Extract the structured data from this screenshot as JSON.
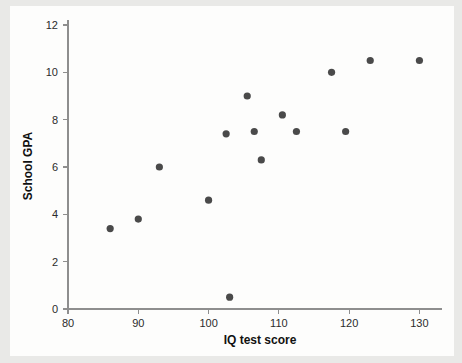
{
  "chart_data": {
    "type": "scatter",
    "title": "",
    "xlabel": "IQ test score",
    "ylabel": "School GPA",
    "xlim": [
      80,
      132.5
    ],
    "ylim": [
      0,
      12
    ],
    "xticks": [
      80,
      90,
      100,
      110,
      120,
      130
    ],
    "yticks": [
      0,
      2,
      4,
      6,
      8,
      10,
      12
    ],
    "xtick_labels": [
      "80",
      "90",
      "100",
      "110",
      "120",
      "130"
    ],
    "ytick_labels": [
      "0",
      "2",
      "4",
      "6",
      "8",
      "10",
      "12"
    ],
    "grid": false,
    "legend": false,
    "n_points": 15,
    "point_color": "#4a4a4a",
    "background_color": "#fdfdfc",
    "figure_background": "#e9e9e7",
    "points": [
      {
        "x": 86,
        "y": 3.4
      },
      {
        "x": 90,
        "y": 3.8
      },
      {
        "x": 93,
        "y": 6.0
      },
      {
        "x": 100,
        "y": 4.6
      },
      {
        "x": 103,
        "y": 0.5
      },
      {
        "x": 102.5,
        "y": 7.4
      },
      {
        "x": 105.5,
        "y": 9.0
      },
      {
        "x": 106.5,
        "y": 7.5
      },
      {
        "x": 107.5,
        "y": 6.3
      },
      {
        "x": 110.5,
        "y": 8.2
      },
      {
        "x": 112.5,
        "y": 7.5
      },
      {
        "x": 117.5,
        "y": 10.0
      },
      {
        "x": 119.5,
        "y": 7.5
      },
      {
        "x": 123,
        "y": 10.5
      },
      {
        "x": 130,
        "y": 10.5
      }
    ]
  }
}
